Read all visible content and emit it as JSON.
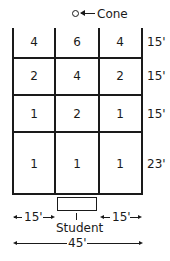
{
  "cone": {
    "label": "Cone",
    "arrow": "←"
  },
  "grid": {
    "rows": [
      {
        "values": [
          "4",
          "6",
          "4"
        ],
        "distance": "15'"
      },
      {
        "values": [
          "2",
          "4",
          "2"
        ],
        "distance": "15'"
      },
      {
        "values": [
          "1",
          "2",
          "1"
        ],
        "distance": "15'"
      },
      {
        "values": [
          "1",
          "1",
          "1"
        ],
        "distance": "23'"
      }
    ]
  },
  "student": {
    "label": "Student"
  },
  "dimensions": {
    "left": "15'",
    "right": "15'",
    "total": "45'"
  }
}
